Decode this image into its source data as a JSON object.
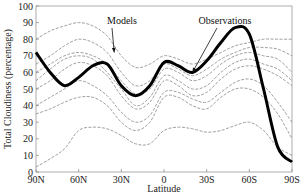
{
  "chart_data": {
    "type": "line",
    "title": "",
    "xlabel": "Latitude",
    "ylabel": "Total Cloudiness (percentage)",
    "x_ticks": [
      "90N",
      "60N",
      "30N",
      "0",
      "30S",
      "60S",
      "90S"
    ],
    "y_ticks": [
      "0",
      "10",
      "20",
      "30",
      "40",
      "50",
      "60",
      "70",
      "80",
      "90",
      "100"
    ],
    "ylim": [
      0,
      100
    ],
    "xlim": [
      90,
      -90
    ],
    "grid": false,
    "legend": "none (annotations with arrows)",
    "annotations": [
      {
        "text": "Models",
        "points_to": [
          35,
          72
        ]
      },
      {
        "text": "Observations",
        "points_to": [
          -20,
          60
        ]
      }
    ],
    "x": [
      90,
      80,
      70,
      60,
      50,
      40,
      30,
      20,
      10,
      0,
      -10,
      -20,
      -30,
      -40,
      -50,
      -60,
      -70,
      -80,
      -90
    ],
    "series": [
      {
        "name": "Observations",
        "style": "thick black",
        "values": [
          72,
          60,
          52,
          57,
          64,
          65,
          52,
          46,
          52,
          66,
          64,
          60,
          67,
          78,
          87,
          83,
          50,
          15,
          6
        ]
      },
      {
        "name": "Model 1",
        "style": "thin gray",
        "values": [
          60,
          65,
          70,
          72,
          70,
          65,
          55,
          47,
          50,
          62,
          60,
          55,
          58,
          65,
          70,
          72,
          70,
          68,
          60
        ]
      },
      {
        "name": "Model 2",
        "style": "thin gray",
        "values": [
          55,
          62,
          68,
          70,
          68,
          60,
          50,
          40,
          45,
          58,
          55,
          50,
          52,
          60,
          66,
          68,
          65,
          62,
          55
        ]
      },
      {
        "name": "Model 3",
        "style": "thin gray",
        "values": [
          80,
          85,
          88,
          90,
          88,
          82,
          70,
          63,
          65,
          70,
          68,
          65,
          68,
          72,
          76,
          78,
          80,
          80,
          80
        ]
      },
      {
        "name": "Model 4",
        "style": "thin gray",
        "values": [
          35,
          38,
          42,
          45,
          45,
          40,
          30,
          25,
          30,
          45,
          45,
          40,
          38,
          45,
          50,
          50,
          45,
          35,
          20
        ]
      },
      {
        "name": "Model 5",
        "style": "thin gray",
        "values": [
          3,
          8,
          14,
          25,
          27,
          26,
          22,
          17,
          17,
          25,
          27,
          26,
          24,
          25,
          28,
          30,
          25,
          15,
          10
        ]
      },
      {
        "name": "Model 6",
        "style": "thin gray",
        "values": [
          50,
          55,
          62,
          66,
          64,
          58,
          46,
          38,
          42,
          55,
          52,
          46,
          48,
          56,
          62,
          64,
          62,
          58,
          52
        ]
      },
      {
        "name": "Model 7",
        "style": "thin gray",
        "values": [
          65,
          70,
          76,
          80,
          78,
          72,
          60,
          52,
          55,
          65,
          62,
          58,
          62,
          68,
          72,
          75,
          75,
          74,
          70
        ]
      },
      {
        "name": "Model 8",
        "style": "thin gray",
        "values": [
          40,
          45,
          50,
          55,
          52,
          46,
          36,
          30,
          34,
          48,
          48,
          44,
          42,
          48,
          54,
          56,
          52,
          42,
          30
        ]
      }
    ]
  }
}
